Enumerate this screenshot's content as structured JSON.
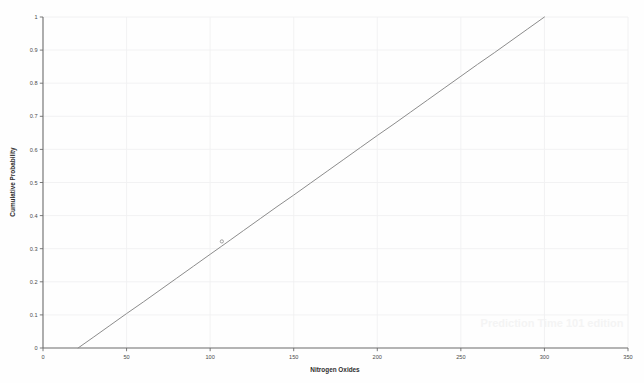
{
  "chart_data": {
    "type": "line",
    "title": "",
    "subtitle": "",
    "xlabel": "Nitrogen Oxides",
    "ylabel": "Cumulative Probability",
    "xlim": [
      0,
      350
    ],
    "ylim": [
      0,
      1
    ],
    "grid": true,
    "legend": null,
    "xticks": [
      0,
      50,
      100,
      150,
      200,
      250,
      300,
      350
    ],
    "xtick_labels": [
      "0",
      "50",
      "100",
      "150",
      "200",
      "250",
      "300",
      "350"
    ],
    "yticks": [
      0,
      0.1,
      0.2,
      0.3,
      0.4,
      0.5,
      0.6,
      0.7,
      0.8,
      0.9,
      1
    ],
    "ytick_labels": [
      "0",
      "0.1",
      "0.2",
      "0.3",
      "0.4",
      "0.5",
      "0.6",
      "0.7",
      "0.8",
      "0.9",
      "1"
    ],
    "series": [
      {
        "name": "Cumulative Probability",
        "color": "#8c8c8c",
        "x": [
          21,
          30,
          40,
          50,
          60,
          70,
          80,
          90,
          100,
          107,
          112,
          120,
          130,
          140,
          150,
          160,
          170,
          180,
          190,
          200,
          210,
          220,
          230,
          240,
          250,
          260,
          270,
          280,
          290,
          300
        ],
        "values": [
          0,
          0.032,
          0.068,
          0.104,
          0.139,
          0.175,
          0.211,
          0.247,
          0.283,
          0.308,
          0.326,
          0.355,
          0.391,
          0.427,
          0.462,
          0.498,
          0.534,
          0.57,
          0.606,
          0.642,
          0.677,
          0.713,
          0.749,
          0.785,
          0.821,
          0.857,
          0.892,
          0.928,
          0.964,
          1
        ]
      }
    ],
    "annotations": [
      {
        "name": "marker-point",
        "x": 107,
        "y": 0.322,
        "label": ""
      }
    ]
  },
  "axes": {
    "x_axis_title": "Nitrogen Oxides",
    "y_axis_title": "Cumulative Probability"
  },
  "watermark": {
    "text": "Prediction Time 101 edition"
  },
  "colors": {
    "background": "#fefefe",
    "plot_background": "#ffffff",
    "line": "#8c8c8c",
    "axis": "#6b6b6b",
    "grid": "#f0f0f2",
    "tick_text": "#4a4a4a",
    "title_text": "#2e2e2e",
    "watermark": "#f4f4f4"
  }
}
